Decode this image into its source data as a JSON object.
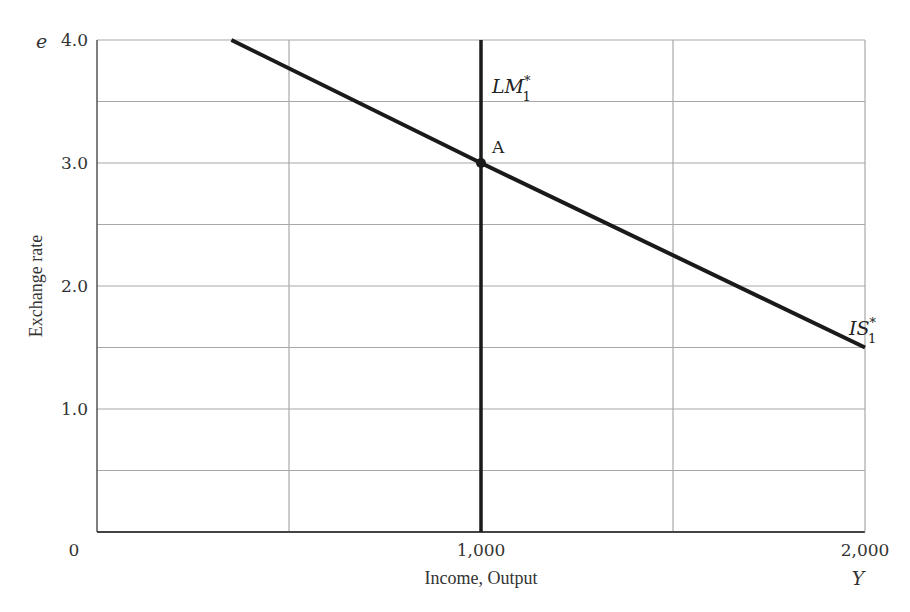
{
  "chart_data": {
    "type": "line",
    "title": "",
    "xlabel": "Income, Output",
    "ylabel": "Exchange rate",
    "x_var": "Y",
    "y_var": "e",
    "xlim": [
      0,
      2000
    ],
    "ylim": [
      0,
      4.0
    ],
    "x_ticks": [
      {
        "value": 0,
        "label": "0"
      },
      {
        "value": 1000,
        "label": "1,000"
      },
      {
        "value": 2000,
        "label": "2,000"
      }
    ],
    "y_ticks": [
      {
        "value": 1.0,
        "label": "1.0"
      },
      {
        "value": 2.0,
        "label": "2.0"
      },
      {
        "value": 3.0,
        "label": "3.0"
      },
      {
        "value": 4.0,
        "label": "4.0"
      }
    ],
    "grid": {
      "on": true,
      "x_step": 500,
      "y_step": 0.5
    },
    "series": [
      {
        "name": "IS*1",
        "label_main": "IS",
        "label_sup": "*",
        "label_sub": "1",
        "points": [
          [
            350,
            4.0
          ],
          [
            1000,
            3.0
          ],
          [
            2000,
            1.5
          ]
        ]
      },
      {
        "name": "LM*1",
        "label_main": "LM",
        "label_sup": "*",
        "label_sub": "1",
        "points": [
          [
            1000,
            0.0
          ],
          [
            1000,
            4.0
          ]
        ]
      }
    ],
    "annotations": [
      {
        "label": "A",
        "x": 1000,
        "y": 3.0,
        "type": "equilibrium-point"
      }
    ],
    "colors": {
      "curve": "#1a1a1a",
      "grid": "#a8a8a8",
      "axis": "#555555"
    }
  }
}
